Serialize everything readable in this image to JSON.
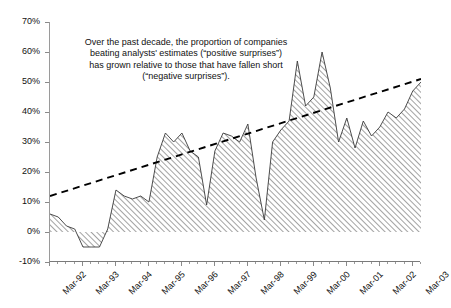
{
  "chart_data": {
    "type": "area",
    "title": "",
    "subtitle": "",
    "xlabel": "",
    "ylabel": "",
    "ylim": [
      -10,
      70
    ],
    "ytick_values": [
      70,
      60,
      50,
      40,
      30,
      20,
      10,
      0,
      -10
    ],
    "ytick_labels": [
      "70%",
      "60%",
      "50%",
      "40%",
      "30%",
      "20%",
      "10%",
      "0%",
      "-10%"
    ],
    "grid": false,
    "legend": "none",
    "categories": [
      "Mar-92",
      "Jun-92",
      "Sep-92",
      "Dec-92",
      "Mar-93",
      "Jun-93",
      "Sep-93",
      "Dec-93",
      "Mar-94",
      "Jun-94",
      "Sep-94",
      "Dec-94",
      "Mar-95",
      "Jun-95",
      "Sep-95",
      "Dec-95",
      "Mar-96",
      "Jun-96",
      "Sep-96",
      "Dec-96",
      "Mar-97",
      "Jun-97",
      "Sep-97",
      "Dec-97",
      "Mar-98",
      "Jun-98",
      "Sep-98",
      "Dec-98",
      "Mar-99",
      "Jun-99",
      "Sep-99",
      "Dec-99",
      "Mar-00",
      "Jun-00",
      "Sep-00",
      "Dec-00",
      "Mar-01",
      "Jun-01",
      "Sep-01",
      "Dec-01",
      "Mar-02",
      "Jun-02",
      "Sep-02",
      "Dec-02",
      "Mar-03",
      "Jun-03"
    ],
    "xtick_labels": [
      "Mar-92",
      "Mar-93",
      "Mar-94",
      "Mar-95",
      "Mar-96",
      "Mar-97",
      "Mar-98",
      "Mar-99",
      "Mar-00",
      "Mar-01",
      "Mar-02",
      "Mar-03"
    ],
    "series": [
      {
        "name": "Net positive earnings surprises",
        "style": "area-hatched",
        "values": [
          6,
          5,
          2,
          1,
          -5,
          -5,
          -5,
          1,
          14,
          12,
          11,
          12,
          10,
          25,
          33,
          30,
          33,
          27,
          25,
          9,
          27,
          33,
          32,
          30,
          36,
          18,
          4,
          30,
          34,
          37,
          57,
          42,
          45,
          60,
          48,
          30,
          38,
          28,
          37,
          32,
          35,
          40,
          38,
          41,
          47,
          50
        ]
      },
      {
        "name": "Linear trend",
        "style": "dashed-line",
        "endpoints": [
          12,
          51
        ]
      }
    ],
    "annotation": "Over the past decade, the proportion of companies\nbeating analysts' estimates (“positive surprises”)\nhas grown relative to those that have fallen short\n(“negative surprises”).",
    "colors": {
      "area_hatch": "#8c8c8c",
      "area_outline": "#3a3a3a",
      "trend_line": "#000000",
      "axis": "#8a8a8a",
      "text": "#111111",
      "background": "#ffffff"
    }
  }
}
